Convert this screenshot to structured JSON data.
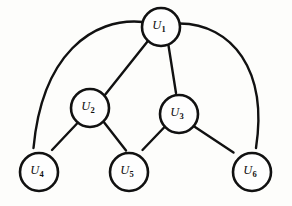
{
  "diagram": {
    "type": "directed-acyclic-graph",
    "title": "",
    "background_color": "#fdfdfb",
    "stroke_color": "#111111",
    "node_fill_color": "#fefefe",
    "node_radius": 19,
    "nodes": [
      {
        "id": "u1",
        "base": "U",
        "subscript": "1",
        "label": "U1",
        "cx": 161,
        "cy": 27,
        "tier": 1
      },
      {
        "id": "u2",
        "base": "U",
        "subscript": "2",
        "label": "U2",
        "cx": 90,
        "cy": 108,
        "tier": 2
      },
      {
        "id": "u3",
        "base": "U",
        "subscript": "3",
        "label": "U3",
        "cx": 179,
        "cy": 114,
        "tier": 2
      },
      {
        "id": "u4",
        "base": "U",
        "subscript": "4",
        "label": "U4",
        "cx": 39,
        "cy": 172,
        "tier": 3
      },
      {
        "id": "u5",
        "base": "U",
        "subscript": "5",
        "label": "U5",
        "cx": 129,
        "cy": 172,
        "tier": 3
      },
      {
        "id": "u6",
        "base": "U",
        "subscript": "6",
        "label": "U6",
        "cx": 252,
        "cy": 172,
        "tier": 3
      }
    ],
    "edges": [
      {
        "id": "e-u1-u2",
        "from": "u1",
        "to": "u2",
        "shape": "straight",
        "path": "M 147.5 41.5 L 104.5 95.5",
        "head_x": 102.5,
        "head_y": 98.0,
        "head_angle": 128.5
      },
      {
        "id": "e-u1-u3",
        "from": "u1",
        "to": "u3",
        "shape": "straight",
        "path": "M 168.5 45.5 L 176.0 93.0",
        "head_x": 176.5,
        "head_y": 96.0,
        "head_angle": 81.0
      },
      {
        "id": "e-u1-u4",
        "from": "u1",
        "to": "u4",
        "shape": "curve",
        "path": "M 143.0 22.0 C 92.0 17.0 42.0 55.0 33.5 148.0",
        "head_x": 33.5,
        "head_y": 152.0,
        "head_angle": 95.0
      },
      {
        "id": "e-u1-u6",
        "from": "u1",
        "to": "u6",
        "shape": "curve",
        "path": "M 179.5 23.5 C 232.0 24.0 268.0 70.0 256.0 148.0",
        "head_x": 255.5,
        "head_y": 152.0,
        "head_angle": 99.0
      },
      {
        "id": "e-u2-u4",
        "from": "u2",
        "to": "u4",
        "shape": "straight",
        "path": "M 78.0 122.5 L 52.0 150.0",
        "head_x": 49.5,
        "head_y": 152.5,
        "head_angle": 133.0
      },
      {
        "id": "e-u2-u5",
        "from": "u2",
        "to": "u5",
        "shape": "straight",
        "path": "M 103.0 121.0 L 126.0 150.5",
        "head_x": 118.5,
        "head_y": 151.5,
        "head_angle": 52.0
      },
      {
        "id": "e-u3-u5",
        "from": "u3",
        "to": "u5",
        "shape": "straight",
        "path": "M 165.0 126.5 L 142.5 150.0",
        "head_x": 140.0,
        "head_y": 152.5,
        "head_angle": 136.0
      },
      {
        "id": "e-u3-u6",
        "from": "u3",
        "to": "u6",
        "shape": "straight",
        "path": "M 193.5 126.0 L 233.5 152.5",
        "head_x": 236.5,
        "head_y": 154.5,
        "head_angle": 34.0
      }
    ]
  }
}
